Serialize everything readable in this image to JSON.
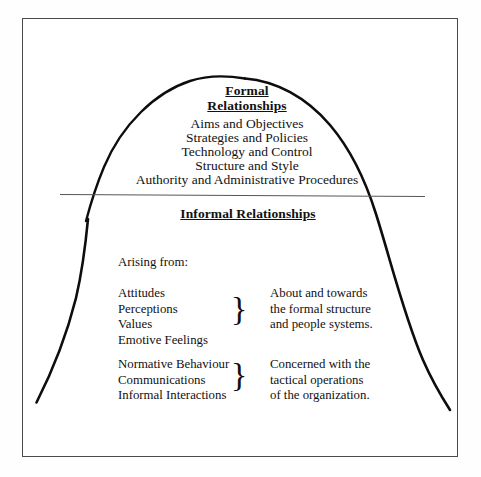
{
  "diagram": {
    "frame": {
      "stroke": "#4a4a4a"
    },
    "curve": {
      "stroke": "#0d0d0d"
    },
    "waterline": {
      "stroke": "#555555"
    }
  },
  "formal": {
    "heading_line1": "Formal",
    "heading_line2": "Relationships",
    "items": [
      "Aims and Objectives",
      "Strategies and Policies",
      "Technology and Control",
      "Structure and Style",
      "Authority and Administrative Procedures"
    ]
  },
  "informal": {
    "heading": "Informal Relationships",
    "arising_label": "Arising from:",
    "groups": [
      {
        "left_items": [
          "Attitudes",
          "Perceptions",
          "Values",
          "Emotive Feelings"
        ],
        "brace": "}",
        "right_items": [
          "About and towards",
          "the formal structure",
          "and people systems."
        ]
      },
      {
        "left_items": [
          "Normative Behaviour",
          "Communications",
          "Informal Interactions"
        ],
        "brace": "}",
        "right_items": [
          "Concerned with the",
          "tactical operations",
          "of the organization."
        ]
      }
    ]
  }
}
